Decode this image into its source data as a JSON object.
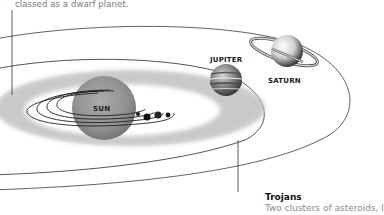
{
  "diagram": {
    "top_caption": "classed as a dwarf planet.",
    "labels": {
      "sun": "SUN",
      "jupiter": "JUPITER",
      "saturn": "SATURN"
    },
    "callouts": {
      "trojans": {
        "title": "Trojans",
        "description": "Two clusters of asteroids, l"
      }
    },
    "colors": {
      "background": "#ffffff",
      "orbit_line": "#2a2a2a",
      "asteroid_belt": "#b8b8b8",
      "sun": "#8e8e8e",
      "caption_text": "#7a7a7a"
    }
  }
}
